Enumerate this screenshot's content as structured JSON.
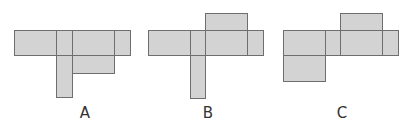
{
  "colors": {
    "fill": "#d3d3d3",
    "stroke": "#6e6e6e",
    "label": "#333333",
    "background": "#ffffff"
  },
  "figures": [
    {
      "id": "A",
      "label": "A",
      "label_x": 85,
      "cells": [
        {
          "x": 14,
          "y": 30,
          "w": 43,
          "h": 26
        },
        {
          "x": 56,
          "y": 30,
          "w": 17,
          "h": 26
        },
        {
          "x": 72,
          "y": 30,
          "w": 43,
          "h": 26
        },
        {
          "x": 114,
          "y": 30,
          "w": 17,
          "h": 26
        },
        {
          "x": 56,
          "y": 55,
          "w": 17,
          "h": 43
        },
        {
          "x": 72,
          "y": 55,
          "w": 43,
          "h": 19
        }
      ]
    },
    {
      "id": "B",
      "label": "B",
      "label_x": 208,
      "cells": [
        {
          "x": 148,
          "y": 30,
          "w": 43,
          "h": 26
        },
        {
          "x": 190,
          "y": 30,
          "w": 16,
          "h": 26
        },
        {
          "x": 205,
          "y": 30,
          "w": 43,
          "h": 26
        },
        {
          "x": 247,
          "y": 30,
          "w": 17,
          "h": 26
        },
        {
          "x": 205,
          "y": 13,
          "w": 43,
          "h": 18
        },
        {
          "x": 190,
          "y": 55,
          "w": 16,
          "h": 44
        }
      ]
    },
    {
      "id": "C",
      "label": "C",
      "label_x": 342,
      "cells": [
        {
          "x": 283,
          "y": 30,
          "w": 43,
          "h": 26
        },
        {
          "x": 325,
          "y": 30,
          "w": 16,
          "h": 26
        },
        {
          "x": 340,
          "y": 30,
          "w": 43,
          "h": 26
        },
        {
          "x": 382,
          "y": 30,
          "w": 17,
          "h": 26
        },
        {
          "x": 340,
          "y": 13,
          "w": 43,
          "h": 18
        },
        {
          "x": 283,
          "y": 55,
          "w": 43,
          "h": 27
        }
      ]
    }
  ]
}
